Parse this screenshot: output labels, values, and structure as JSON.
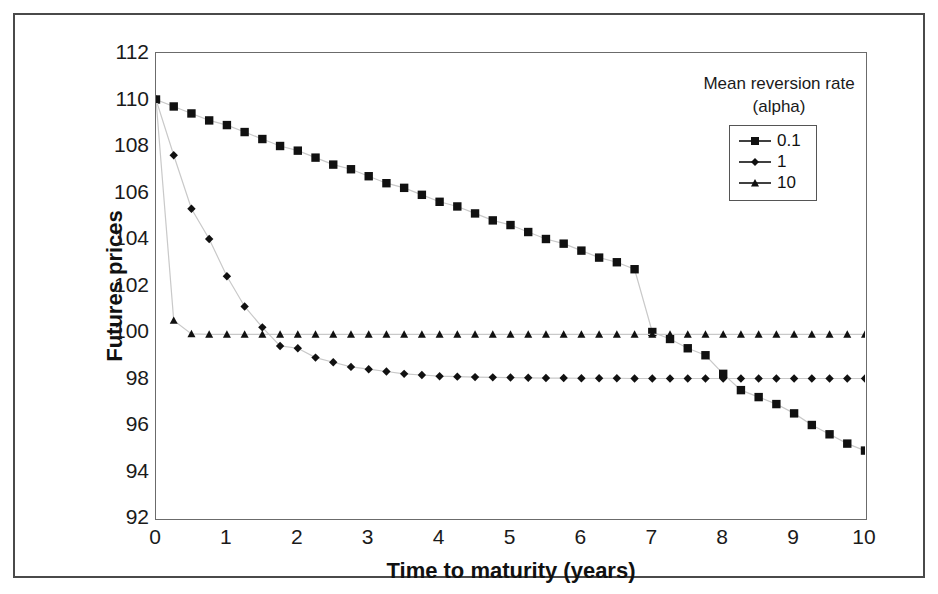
{
  "chart_data": {
    "type": "line",
    "title": "",
    "xlabel": "Time to maturity (years)",
    "ylabel": "Futures prices",
    "xlim": [
      0,
      10
    ],
    "ylim": [
      92,
      112
    ],
    "xticks": [
      "0",
      "1",
      "2",
      "3",
      "4",
      "5",
      "6",
      "7",
      "8",
      "9",
      "10"
    ],
    "yticks": [
      "92",
      "94",
      "96",
      "98",
      "100",
      "102",
      "104",
      "106",
      "108",
      "110",
      "112"
    ],
    "grid": false,
    "legend": {
      "title_line1": "Mean reversion rate",
      "title_line2": "(alpha)",
      "position": "top-right",
      "entries": [
        {
          "label": "0.1",
          "marker": "square"
        },
        {
          "label": "1",
          "marker": "diamond"
        },
        {
          "label": "10",
          "marker": "triangle"
        }
      ]
    },
    "x": [
      0,
      0.25,
      0.5,
      0.75,
      1,
      1.25,
      1.5,
      1.75,
      2,
      2.25,
      2.5,
      2.75,
      3,
      3.25,
      3.5,
      3.75,
      4,
      4.25,
      4.5,
      4.75,
      5,
      5.25,
      5.5,
      5.75,
      6,
      6.25,
      6.5,
      6.75,
      7,
      7.25,
      7.5,
      7.75,
      8,
      8.25,
      8.5,
      8.75,
      9,
      9.25,
      9.5,
      9.75,
      10
    ],
    "series": [
      {
        "name": "0.1",
        "marker": "square",
        "color": "#111111",
        "values": [
          110,
          109.7,
          109.4,
          109.1,
          108.9,
          108.6,
          108.3,
          108,
          107.8,
          107.5,
          107.2,
          107,
          106.7,
          106.4,
          106.2,
          105.9,
          105.6,
          105.4,
          105.1,
          104.8,
          104.6,
          104.3,
          104,
          103.8,
          103.5,
          103.2,
          103,
          102.7,
          100,
          99.7,
          99.3,
          99,
          98.2,
          97.5,
          97.2,
          96.9,
          96.5,
          96,
          95.6,
          95.2,
          94.9
        ]
      },
      {
        "name": "1",
        "marker": "diamond",
        "color": "#111111",
        "values": [
          110,
          107.6,
          105.3,
          104,
          102.4,
          101.1,
          100.2,
          99.4,
          99.3,
          98.9,
          98.7,
          98.5,
          98.4,
          98.3,
          98.2,
          98.15,
          98.1,
          98.08,
          98.06,
          98.05,
          98.04,
          98.03,
          98.02,
          98.02,
          98.01,
          98.01,
          98.01,
          98,
          98,
          98,
          98,
          98,
          98,
          98,
          98,
          98,
          98,
          98,
          98,
          98,
          98
        ]
      },
      {
        "name": "10",
        "marker": "triangle",
        "color": "#111111",
        "values": [
          110,
          100.5,
          99.92,
          99.9,
          99.9,
          99.9,
          99.9,
          99.9,
          99.9,
          99.9,
          99.9,
          99.9,
          99.9,
          99.9,
          99.9,
          99.9,
          99.9,
          99.9,
          99.9,
          99.9,
          99.9,
          99.9,
          99.9,
          99.9,
          99.9,
          99.9,
          99.9,
          99.9,
          99.9,
          99.9,
          99.9,
          99.9,
          99.9,
          99.9,
          99.9,
          99.9,
          99.9,
          99.9,
          99.9,
          99.9,
          99.9
        ]
      }
    ]
  }
}
